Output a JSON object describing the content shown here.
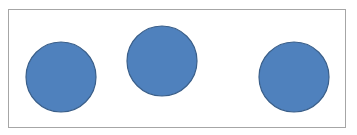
{
  "diagram": {
    "frame": {
      "border_color": "#a6a6a6",
      "background": "#ffffff"
    },
    "shapes": [
      {
        "type": "circle",
        "cx": 61,
        "cy": 77,
        "r": 35,
        "fill": "#4f81bd",
        "stroke": "#3a5f8a"
      },
      {
        "type": "circle",
        "cx": 162,
        "cy": 61,
        "r": 35,
        "fill": "#4f81bd",
        "stroke": "#3a5f8a"
      },
      {
        "type": "circle",
        "cx": 294,
        "cy": 77,
        "r": 35,
        "fill": "#4f81bd",
        "stroke": "#3a5f8a"
      }
    ]
  }
}
